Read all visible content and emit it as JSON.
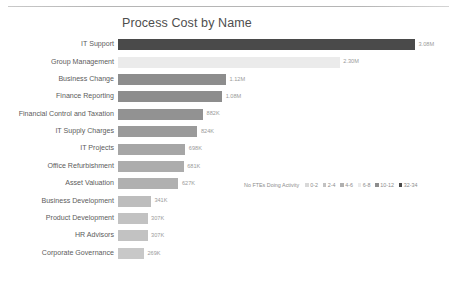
{
  "chart_data": {
    "type": "bar",
    "title": "Process Cost by Name",
    "xlabel": "",
    "ylabel": "",
    "orientation": "horizontal",
    "grid": false,
    "xlim": [
      0,
      3080000
    ],
    "categories": [
      "IT Support",
      "Group Management",
      "Business Change",
      "Finance Reporting",
      "Financial Control and Taxation",
      "IT Supply Charges",
      "IT Projects",
      "Office Refurbishment",
      "Asset Valuation",
      "Business Development",
      "Product Development",
      "HR Advisors",
      "Corporate Governance"
    ],
    "values": [
      3080000,
      2300000,
      1120000,
      1080000,
      882000,
      824000,
      698000,
      681000,
      627000,
      341000,
      307000,
      307000,
      269000
    ],
    "value_labels": [
      "3.08M",
      "2.30M",
      "1.12M",
      "1.08M",
      "882K",
      "824K",
      "698K",
      "681K",
      "627K",
      "341K",
      "307K",
      "307K",
      "269K"
    ],
    "bar_colors": [
      "#4a4a4a",
      "#ebebeb",
      "#8d8d8d",
      "#8d8d8d",
      "#929292",
      "#9a9a9a",
      "#a6a6a6",
      "#acacac",
      "#b0b0b0",
      "#bdbdbd",
      "#c2c2c2",
      "#c2c2c2",
      "#c8c8c8"
    ],
    "legend": {
      "title": "No FTEs Doing Activity",
      "position": "bottom-right",
      "entries": [
        {
          "label": "0-2",
          "color": "#d8d8d8"
        },
        {
          "label": "2-4",
          "color": "#c2c2c2"
        },
        {
          "label": "4-6",
          "color": "#b0b0b0"
        },
        {
          "label": "6-8",
          "color": "#ebebeb"
        },
        {
          "label": "10-12",
          "color": "#8d8d8d"
        },
        {
          "label": "32-34",
          "color": "#4a4a4a"
        }
      ]
    }
  }
}
